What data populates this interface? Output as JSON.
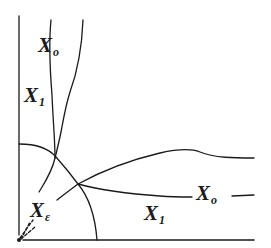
{
  "diagram": {
    "type": "phase-region-diagram",
    "stroke_color": "#1a1a1a",
    "background": "#ffffff",
    "labels": [
      {
        "id": "x0-upper",
        "base": "X",
        "sub": "o",
        "x": 38,
        "y": 35
      },
      {
        "id": "x1-left",
        "base": "X",
        "sub": "1",
        "x": 24,
        "y": 85
      },
      {
        "id": "xeps-origin",
        "base": "X",
        "sub": "ε",
        "x": 30,
        "y": 200
      },
      {
        "id": "x0-right",
        "base": "X",
        "sub": "o",
        "x": 194,
        "y": 183
      },
      {
        "id": "x1-bottom",
        "base": "X",
        "sub": "1",
        "x": 144,
        "y": 203
      }
    ],
    "axes": {
      "vertical": {
        "x": 19,
        "y1": 16,
        "y2": 235
      },
      "horizontal": {
        "y": 240,
        "x1": 23,
        "x2": 254
      },
      "origin": {
        "x": 19,
        "y": 240
      }
    }
  }
}
